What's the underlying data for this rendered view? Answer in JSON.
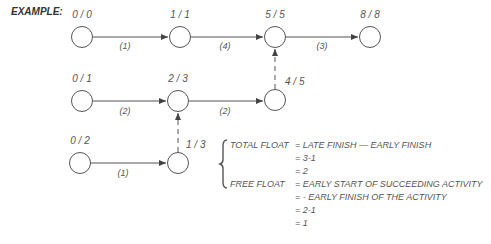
{
  "title": "EXAMPLE:",
  "nodes": [
    {
      "id": "n1",
      "label": "0 / 0"
    },
    {
      "id": "n2",
      "label": "1 / 1"
    },
    {
      "id": "n3",
      "label": "5 / 5"
    },
    {
      "id": "n4",
      "label": "8 / 8"
    },
    {
      "id": "n5",
      "label": "0 / 1"
    },
    {
      "id": "n6",
      "label": "2 / 3"
    },
    {
      "id": "n7",
      "label": "4 / 5"
    },
    {
      "id": "n8",
      "label": "0 / 2"
    },
    {
      "id": "n9",
      "label": "1 / 3"
    }
  ],
  "activities": [
    {
      "from": "n1",
      "to": "n2",
      "duration": "(1)",
      "type": "solid"
    },
    {
      "from": "n2",
      "to": "n3",
      "duration": "(4)",
      "type": "solid"
    },
    {
      "from": "n3",
      "to": "n4",
      "duration": "(3)",
      "type": "solid"
    },
    {
      "from": "n5",
      "to": "n6",
      "duration": "(2)",
      "type": "solid"
    },
    {
      "from": "n6",
      "to": "n7",
      "duration": "(2)",
      "type": "solid"
    },
    {
      "from": "n8",
      "to": "n9",
      "duration": "(1)",
      "type": "solid"
    },
    {
      "from": "n7",
      "to": "n3",
      "duration": "",
      "type": "dummy"
    },
    {
      "from": "n9",
      "to": "n6",
      "duration": "",
      "type": "dummy"
    }
  ],
  "formulas": {
    "total_float_label": "TOTAL FLOAT",
    "total_float_lines": [
      "= LATE FINISH — EARLY FINISH",
      "= 3-1",
      "= 2"
    ],
    "free_float_label": "FREE FLOAT",
    "free_float_lines": [
      "= EARLY START OF SUCCEEDING ACTIVITY",
      "= - EARLY FINISH OF THE ACTIVITY",
      "= 2-1",
      "= 1"
    ]
  },
  "colors": {
    "line": "#555555",
    "text": "#555555"
  }
}
